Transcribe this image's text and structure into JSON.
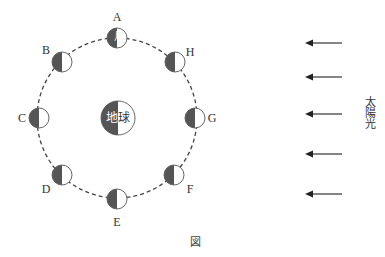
{
  "diagram": {
    "earth": {
      "label_dark": "地",
      "label_light": "球",
      "cx": 118,
      "cy": 118,
      "r": 17
    },
    "moon_label": "月",
    "orbit": {
      "cx": 117,
      "cy": 118,
      "r": 80,
      "style": "dashed"
    },
    "moons": [
      {
        "id": "A",
        "cx": 117,
        "cy": 38,
        "lx": 117,
        "ly": 17
      },
      {
        "id": "B",
        "cx": 62,
        "cy": 62,
        "lx": 46,
        "ly": 50
      },
      {
        "id": "C",
        "cx": 39,
        "cy": 118,
        "lx": 22,
        "ly": 118
      },
      {
        "id": "D",
        "cx": 62,
        "cy": 175,
        "lx": 46,
        "ly": 189
      },
      {
        "id": "E",
        "cx": 117,
        "cy": 199,
        "lx": 117,
        "ly": 222
      },
      {
        "id": "F",
        "cx": 174,
        "cy": 175,
        "lx": 190,
        "ly": 189
      },
      {
        "id": "G",
        "cx": 195,
        "cy": 118,
        "lx": 212,
        "ly": 118
      },
      {
        "id": "H",
        "cx": 175,
        "cy": 62,
        "lx": 190,
        "ly": 52
      }
    ],
    "sunlight": {
      "label": "太陽光",
      "arrow_direction": "left",
      "arrows_y": [
        43,
        77,
        114,
        154,
        194
      ]
    },
    "caption": "図",
    "colors": {
      "dark_side": "#555555",
      "outline": "#666666",
      "light_side": "#ffffff"
    }
  }
}
